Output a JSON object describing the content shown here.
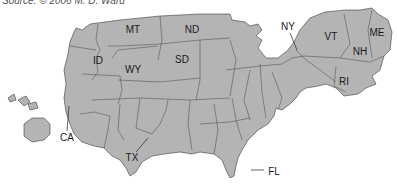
{
  "source": "Source: © 2006 M. D. Ward",
  "map": {
    "type": "cartogram",
    "fill_color": "#b4b4b4",
    "border_color": "#3a3a3a",
    "labels": [
      {
        "id": "MT",
        "text": "MT"
      },
      {
        "id": "ND",
        "text": "ND"
      },
      {
        "id": "ID",
        "text": "ID"
      },
      {
        "id": "WY",
        "text": "WY"
      },
      {
        "id": "SD",
        "text": "SD"
      },
      {
        "id": "NY",
        "text": "NY"
      },
      {
        "id": "VT",
        "text": "VT"
      },
      {
        "id": "NH",
        "text": "NH"
      },
      {
        "id": "ME",
        "text": "ME"
      },
      {
        "id": "RI",
        "text": "RI"
      },
      {
        "id": "CA",
        "text": "CA"
      },
      {
        "id": "TX",
        "text": "TX"
      },
      {
        "id": "FL",
        "text": "FL"
      }
    ]
  }
}
